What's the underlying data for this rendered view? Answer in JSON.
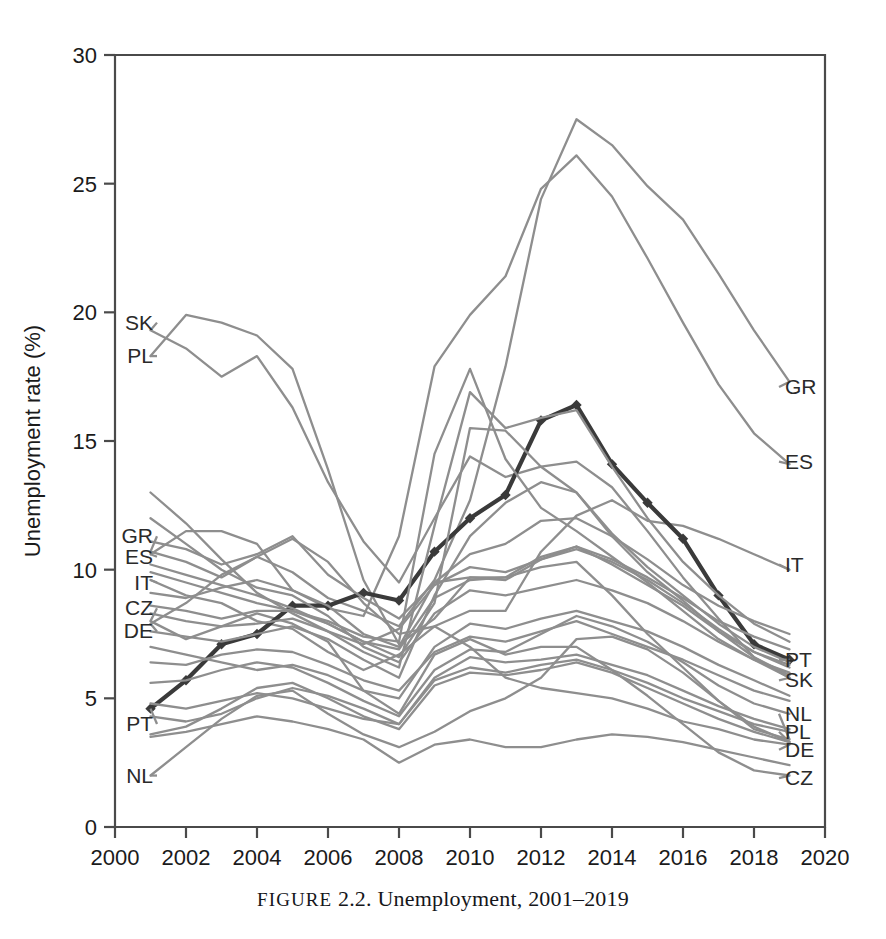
{
  "caption": {
    "prefix": "FIGURE",
    "rest": "2.2. Unemployment, 2001–2019"
  },
  "chart_data": {
    "type": "line",
    "title": "",
    "xlabel": "",
    "ylabel": "Unemployment rate (%)",
    "xlim": [
      2000,
      2020
    ],
    "ylim": [
      0,
      30
    ],
    "xticks": [
      2000,
      2002,
      2004,
      2006,
      2008,
      2010,
      2012,
      2014,
      2016,
      2018,
      2020
    ],
    "yticks": [
      0,
      5,
      10,
      15,
      20,
      25,
      30
    ],
    "grid": false,
    "legend": "inline-endpoint-labels",
    "x": [
      2001,
      2002,
      2003,
      2004,
      2005,
      2006,
      2007,
      2008,
      2009,
      2010,
      2011,
      2012,
      2013,
      2014,
      2015,
      2016,
      2017,
      2018,
      2019
    ],
    "highlight_series": "PT",
    "series": [
      {
        "name": "SK",
        "color": "#8e8e8e",
        "label_left": "SK",
        "label_right": "SK",
        "values": [
          19.3,
          18.6,
          17.5,
          18.3,
          16.3,
          13.4,
          11.1,
          9.5,
          12.0,
          14.4,
          13.6,
          14.0,
          14.2,
          13.2,
          11.5,
          9.7,
          8.1,
          6.6,
          5.8
        ]
      },
      {
        "name": "PL",
        "color": "#8e8e8e",
        "label_left": "PL",
        "label_right": "PL",
        "values": [
          18.3,
          19.9,
          19.6,
          19.1,
          17.8,
          13.9,
          9.6,
          7.1,
          8.1,
          9.7,
          9.7,
          10.1,
          10.3,
          9.0,
          7.5,
          6.2,
          4.9,
          3.9,
          3.3
        ]
      },
      {
        "name": "GR",
        "color": "#8e8e8e",
        "label_left": "GR",
        "label_right": "GR",
        "values": [
          10.7,
          10.3,
          9.7,
          10.5,
          9.9,
          8.9,
          8.4,
          7.8,
          9.6,
          12.7,
          17.9,
          24.4,
          27.5,
          26.5,
          24.9,
          23.6,
          21.5,
          19.3,
          17.3
        ]
      },
      {
        "name": "ES",
        "color": "#8e8e8e",
        "label_left": "ES",
        "label_right": "ES",
        "values": [
          10.6,
          11.5,
          11.5,
          11.0,
          9.2,
          8.5,
          8.2,
          11.3,
          17.9,
          19.9,
          21.4,
          24.8,
          26.1,
          24.5,
          22.1,
          19.6,
          17.2,
          15.3,
          14.1
        ]
      },
      {
        "name": "IT",
        "color": "#8e8e8e",
        "label_left": "IT",
        "label_right": "IT",
        "values": [
          9.6,
          9.0,
          8.7,
          8.0,
          7.7,
          6.8,
          6.1,
          6.7,
          7.8,
          8.4,
          8.4,
          10.7,
          12.1,
          12.7,
          11.9,
          11.7,
          11.2,
          10.6,
          10.0
        ]
      },
      {
        "name": "CZ",
        "color": "#8e8e8e",
        "label_left": "CZ",
        "label_right": "CZ",
        "values": [
          8.0,
          7.3,
          7.8,
          8.3,
          7.9,
          7.2,
          5.3,
          4.4,
          6.7,
          7.3,
          6.7,
          7.0,
          7.0,
          6.1,
          5.1,
          4.0,
          2.9,
          2.2,
          2.0
        ]
      },
      {
        "name": "DE",
        "color": "#8e8e8e",
        "label_left": "DE",
        "label_right": "DE",
        "values": [
          7.9,
          8.7,
          9.8,
          10.5,
          11.2,
          10.3,
          8.7,
          7.5,
          7.8,
          7.0,
          5.8,
          5.4,
          5.2,
          5.0,
          4.6,
          4.1,
          3.8,
          3.4,
          3.2
        ]
      },
      {
        "name": "PT",
        "color": "#3a3a3a",
        "label_left": "PT",
        "label_right": "PT",
        "highlight": true,
        "values": [
          4.6,
          5.7,
          7.1,
          7.5,
          8.6,
          8.6,
          9.1,
          8.8,
          10.7,
          12.0,
          12.9,
          15.8,
          16.4,
          14.1,
          12.6,
          11.2,
          9.0,
          7.1,
          6.5
        ]
      },
      {
        "name": "NL",
        "color": "#8e8e8e",
        "label_left": "NL",
        "label_right": "NL",
        "values": [
          2.0,
          3.1,
          4.2,
          5.1,
          5.3,
          4.4,
          3.6,
          3.1,
          3.7,
          4.5,
          5.0,
          5.8,
          7.3,
          7.4,
          6.9,
          6.0,
          4.9,
          3.8,
          3.4
        ]
      },
      {
        "name": "S1",
        "color": "#8e8e8e",
        "values": [
          13.0,
          11.8,
          10.4,
          9.1,
          8.3,
          7.6,
          7.1,
          7.7,
          9.4,
          10.1,
          9.9,
          10.4,
          10.9,
          10.2,
          9.4,
          8.6,
          7.6,
          6.8,
          6.3
        ]
      },
      {
        "name": "S2",
        "color": "#8e8e8e",
        "values": [
          11.1,
          10.8,
          10.2,
          10.6,
          11.3,
          9.8,
          8.9,
          8.1,
          9.5,
          10.6,
          11.0,
          11.9,
          12.0,
          11.3,
          10.4,
          9.4,
          8.6,
          8.0,
          7.5
        ]
      },
      {
        "name": "S3",
        "color": "#8e8e8e",
        "values": [
          9.1,
          8.9,
          9.3,
          9.6,
          9.2,
          8.6,
          7.5,
          7.0,
          9.5,
          9.7,
          9.6,
          10.4,
          10.8,
          10.3,
          9.6,
          8.7,
          7.7,
          6.8,
          6.2
        ]
      },
      {
        "name": "S4",
        "color": "#8e8e8e",
        "values": [
          8.6,
          8.4,
          8.1,
          8.4,
          8.4,
          7.9,
          7.2,
          6.9,
          8.9,
          9.6,
          9.7,
          10.5,
          10.9,
          10.4,
          9.7,
          8.9,
          8.0,
          7.4,
          6.9
        ]
      },
      {
        "name": "S5",
        "color": "#8e8e8e",
        "values": [
          7.0,
          6.7,
          6.4,
          6.1,
          6.3,
          5.9,
          5.3,
          5.0,
          7.0,
          7.9,
          7.7,
          8.1,
          8.4,
          8.0,
          7.6,
          7.0,
          6.3,
          5.7,
          5.1
        ]
      },
      {
        "name": "S6",
        "color": "#8e8e8e",
        "values": [
          6.4,
          6.3,
          6.7,
          6.9,
          6.8,
          6.3,
          5.7,
          5.3,
          6.8,
          7.4,
          7.2,
          7.6,
          8.0,
          7.5,
          7.0,
          6.5,
          5.9,
          5.3,
          4.9
        ]
      },
      {
        "name": "S7",
        "color": "#8e8e8e",
        "values": [
          5.6,
          5.7,
          6.1,
          6.4,
          6.2,
          5.6,
          4.9,
          4.3,
          6.1,
          6.9,
          6.8,
          7.5,
          8.2,
          7.8,
          7.2,
          6.4,
          5.5,
          4.8,
          4.4
        ]
      },
      {
        "name": "S8",
        "color": "#8e8e8e",
        "values": [
          4.8,
          4.6,
          4.9,
          5.2,
          5.0,
          4.6,
          4.2,
          4.0,
          5.8,
          6.6,
          6.4,
          6.5,
          6.7,
          6.3,
          5.9,
          5.3,
          4.7,
          4.2,
          3.8
        ]
      },
      {
        "name": "S9",
        "color": "#8e8e8e",
        "values": [
          4.3,
          4.1,
          4.4,
          5.0,
          5.4,
          5.1,
          4.6,
          4.0,
          5.7,
          6.2,
          6.0,
          6.3,
          6.5,
          6.1,
          5.6,
          5.0,
          4.5,
          4.0,
          3.7
        ]
      },
      {
        "name": "S10",
        "color": "#8e8e8e",
        "values": [
          3.6,
          3.9,
          4.6,
          5.4,
          5.6,
          5.0,
          4.3,
          3.8,
          5.5,
          6.0,
          5.9,
          6.1,
          6.4,
          6.0,
          5.4,
          4.8,
          4.2,
          3.7,
          3.3
        ]
      },
      {
        "name": "S11",
        "color": "#8e8e8e",
        "values": [
          3.5,
          3.7,
          4.0,
          4.3,
          4.1,
          3.8,
          3.4,
          2.5,
          3.2,
          3.4,
          3.1,
          3.1,
          3.4,
          3.6,
          3.5,
          3.3,
          3.0,
          2.7,
          2.4
        ]
      },
      {
        "name": "S12",
        "color": "#8e8e8e",
        "values": [
          12.0,
          11.0,
          10.0,
          9.3,
          9.0,
          8.2,
          7.0,
          6.4,
          8.3,
          9.2,
          9.0,
          9.3,
          9.6,
          9.2,
          8.7,
          8.0,
          7.2,
          6.5,
          6.0
        ]
      },
      {
        "name": "S13",
        "color": "#8e8e8e",
        "values": [
          10.2,
          9.8,
          9.4,
          9.0,
          8.5,
          7.9,
          7.2,
          6.6,
          8.7,
          15.5,
          15.4,
          14.0,
          13.0,
          11.3,
          9.9,
          8.8,
          7.6,
          6.6,
          5.9
        ]
      },
      {
        "name": "S14",
        "color": "#8e8e8e",
        "values": [
          9.9,
          9.5,
          9.1,
          8.7,
          8.4,
          8.0,
          7.4,
          7.2,
          14.5,
          17.8,
          14.3,
          12.4,
          11.5,
          10.5,
          9.5,
          8.4,
          7.3,
          6.5,
          5.8
        ]
      },
      {
        "name": "S15",
        "color": "#8e8e8e",
        "values": [
          8.3,
          8.0,
          7.8,
          7.9,
          8.1,
          7.6,
          6.8,
          6.2,
          11.7,
          16.9,
          15.5,
          15.9,
          16.2,
          14.0,
          12.0,
          10.3,
          9.0,
          7.9,
          7.2
        ]
      },
      {
        "name": "S16",
        "color": "#8e8e8e",
        "values": [
          7.6,
          7.4,
          7.2,
          7.5,
          7.8,
          7.3,
          6.5,
          5.8,
          9.0,
          11.3,
          12.6,
          13.4,
          13.0,
          11.4,
          10.1,
          9.0,
          7.9,
          7.0,
          6.4
        ]
      }
    ]
  },
  "axis": {
    "y_title": "Unemployment rate (%)"
  }
}
